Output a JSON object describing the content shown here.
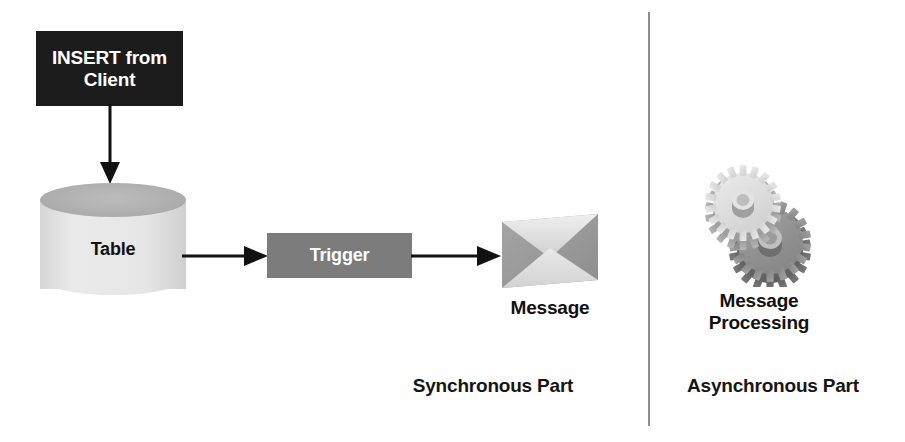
{
  "diagram": {
    "background_color": "#ffffff",
    "nodes": {
      "insert": {
        "label": "INSERT from\nClient",
        "shape": "rectangle",
        "fill_color": "#1c1c1c",
        "text_color": "#ffffff"
      },
      "table": {
        "label": "Table",
        "shape": "cylinder",
        "fill_color": "#e6e6e6",
        "top_color": "#b0b0b0",
        "text_color": "#111111"
      },
      "trigger": {
        "label": "Trigger",
        "shape": "rectangle",
        "fill_color": "#7c7c7c",
        "text_color": "#ffffff"
      },
      "message": {
        "label": "Message",
        "shape": "envelope",
        "fill_color": "#9a9a9a",
        "flap_color": "#dcdcdc",
        "text_color": "#111111"
      },
      "message_processing": {
        "label": "Message\nProcessing",
        "shape": "gears",
        "gear_light_color": "#d9d9d9",
        "gear_dark_color": "#8f8f8f",
        "text_color": "#111111"
      }
    },
    "edges": [
      {
        "from": "insert",
        "to": "table",
        "direction": "down",
        "style": "solid-arrow",
        "color": "#111111"
      },
      {
        "from": "table",
        "to": "trigger",
        "direction": "right",
        "style": "solid-arrow",
        "color": "#111111"
      },
      {
        "from": "trigger",
        "to": "message",
        "direction": "right",
        "style": "solid-arrow",
        "color": "#111111"
      }
    ],
    "divider": {
      "orientation": "vertical",
      "color": "#8e8e8e"
    },
    "captions": {
      "synchronous": "Synchronous Part",
      "asynchronous": "Asynchronous Part"
    }
  }
}
